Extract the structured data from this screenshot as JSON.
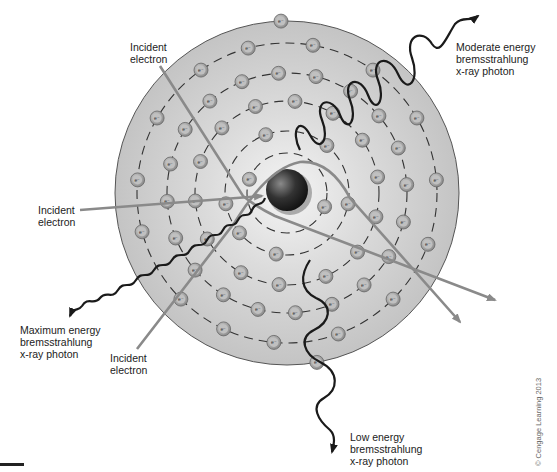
{
  "diagram": {
    "labels": {
      "incident_top": "Incident\nelectron",
      "incident_left": "Incident\nelectron",
      "incident_bottom": "Incident\nelectron",
      "moderate": "Moderate energy\nbremsstrahlung\nx-ray photon",
      "maximum": "Maximum energy\nbremsstrahlung\nx-ray photon",
      "low": "Low energy\nbremsstrahlung\nx-ray photon"
    },
    "electron_symbol": "e⁻",
    "copyright": "© Cengage Learning 2013",
    "colors": {
      "atom_fill": "#c8c8c8",
      "atom_center": "#f2f2f2",
      "nucleus": "#3a3a3a",
      "electron_path": "#8a8a8a",
      "photon": "#1a1a1a",
      "text": "#222222"
    },
    "atom": {
      "center": [
        287,
        193
      ],
      "outer_radius": 172,
      "orbit_radii": [
        40,
        62,
        92,
        120,
        150
      ]
    }
  }
}
